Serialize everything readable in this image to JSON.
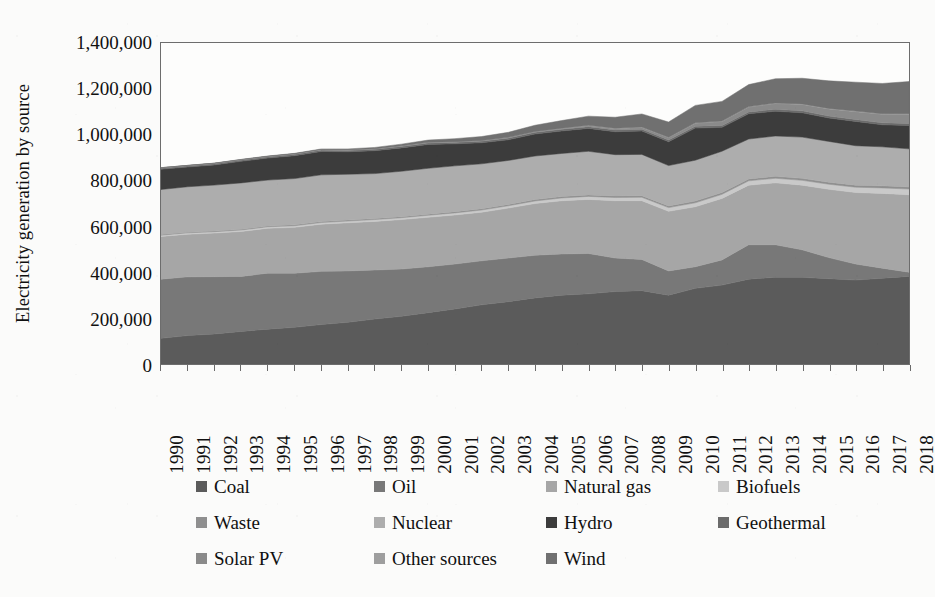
{
  "chart_data": {
    "type": "area",
    "stacked": true,
    "title": "",
    "xlabel": "",
    "ylabel": "Electricity generation by source",
    "ylim": [
      0,
      1400000
    ],
    "ytick_step": 200000,
    "yticks": [
      "0",
      "200,000",
      "400,000",
      "600,000",
      "800,000",
      "1,000,000",
      "1,200,000",
      "1,400,000"
    ],
    "ytick_values": [
      0,
      200000,
      400000,
      600000,
      800000,
      1000000,
      1200000,
      1400000
    ],
    "grid": false,
    "legend_position": "bottom",
    "categories": [
      "1990",
      "1991",
      "1992",
      "1993",
      "1994",
      "1995",
      "1996",
      "1997",
      "1998",
      "1999",
      "2000",
      "2001",
      "2002",
      "2003",
      "2004",
      "2005",
      "2006",
      "2007",
      "2008",
      "2009",
      "2010",
      "2011",
      "2012",
      "2013",
      "2014",
      "2015",
      "2016",
      "2017",
      "2018"
    ],
    "series": [
      {
        "name": "Coal",
        "color": "#5b5b5b",
        "values": [
          112000,
          124000,
          131000,
          142000,
          152000,
          160000,
          172000,
          182000,
          196000,
          208000,
          224000,
          240000,
          258000,
          272000,
          288000,
          300000,
          306000,
          316000,
          320000,
          300000,
          330000,
          344000,
          370000,
          378000,
          378000,
          372000,
          366000,
          374000,
          382000
        ]
      },
      {
        "name": "Oil",
        "color": "#787878",
        "values": [
          258000,
          256000,
          250000,
          240000,
          244000,
          236000,
          232000,
          224000,
          214000,
          206000,
          200000,
          196000,
          192000,
          190000,
          186000,
          180000,
          176000,
          146000,
          136000,
          106000,
          94000,
          110000,
          150000,
          142000,
          120000,
          92000,
          70000,
          44000,
          18000
        ]
      },
      {
        "name": "Natural gas",
        "color": "#a6a6a6",
        "values": [
          186000,
          186000,
          190000,
          196000,
          196000,
          200000,
          206000,
          210000,
          212000,
          216000,
          216000,
          214000,
          212000,
          218000,
          226000,
          232000,
          236000,
          250000,
          256000,
          260000,
          262000,
          268000,
          260000,
          270000,
          282000,
          298000,
          312000,
          326000,
          338000
        ]
      },
      {
        "name": "Biofuels",
        "color": "#c9c9c9",
        "values": [
          6000,
          6000,
          6000,
          6500,
          6500,
          7000,
          7000,
          7500,
          8000,
          8000,
          8500,
          9000,
          9500,
          10000,
          11000,
          12000,
          13000,
          14000,
          15000,
          16000,
          17000,
          18000,
          19000,
          20000,
          21000,
          22000,
          23000,
          24000,
          25000
        ]
      },
      {
        "name": "Waste",
        "color": "#8f8f8f",
        "values": [
          3000,
          3000,
          3200,
          3400,
          3600,
          3800,
          4000,
          4200,
          4400,
          4600,
          5000,
          5200,
          5500,
          5800,
          6000,
          6300,
          6600,
          7000,
          7200,
          7400,
          7800,
          8000,
          8200,
          8400,
          8600,
          8800,
          9000,
          9200,
          9400
        ]
      },
      {
        "name": "Nuclear",
        "color": "#adadad",
        "values": [
          196000,
          198000,
          200000,
          202000,
          200000,
          202000,
          204000,
          200000,
          196000,
          198000,
          200000,
          200000,
          196000,
          192000,
          190000,
          188000,
          190000,
          180000,
          180000,
          176000,
          178000,
          180000,
          174000,
          176000,
          180000,
          178000,
          172000,
          170000,
          166000
        ]
      },
      {
        "name": "Hydro",
        "color": "#3c3c3c",
        "values": [
          88000,
          86000,
          88000,
          94000,
          96000,
          100000,
          102000,
          98000,
          100000,
          102000,
          104000,
          96000,
          92000,
          90000,
          96000,
          98000,
          100000,
          100000,
          102000,
          104000,
          140000,
          104000,
          110000,
          108000,
          106000,
          102000,
          106000,
          96000,
          102000
        ]
      },
      {
        "name": "Geothermal",
        "color": "#6b6b6b",
        "values": [
          6000,
          6000,
          6200,
          6400,
          6400,
          6600,
          6600,
          6800,
          6800,
          7000,
          7000,
          7200,
          7200,
          7400,
          7400,
          7600,
          7600,
          7800,
          7800,
          8000,
          8000,
          8200,
          8200,
          8400,
          8400,
          8600,
          8600,
          8800,
          8800
        ]
      },
      {
        "name": "Solar PV",
        "color": "#8a8a8a",
        "values": [
          0,
          0,
          0,
          0,
          0,
          0,
          100,
          200,
          300,
          400,
          600,
          900,
          1200,
          1600,
          2200,
          3000,
          4000,
          5500,
          7500,
          10000,
          13000,
          17000,
          21000,
          25000,
          28000,
          31000,
          34000,
          37000,
          40000
        ]
      },
      {
        "name": "Other sources",
        "color": "#9e9e9e",
        "values": [
          1000,
          1000,
          1100,
          1100,
          1200,
          1200,
          1300,
          1300,
          1400,
          1400,
          1500,
          1500,
          1600,
          1600,
          1700,
          1800,
          1800,
          1900,
          2000,
          2000,
          2100,
          2200,
          2200,
          2300,
          2400,
          2400,
          2500,
          2600,
          2600
        ]
      },
      {
        "name": "Wind",
        "color": "#707070",
        "values": [
          200,
          400,
          700,
          1000,
          1500,
          2200,
          3000,
          4200,
          5600,
          7500,
          10000,
          13000,
          17000,
          22000,
          27000,
          33000,
          40000,
          48000,
          57000,
          66000,
          76000,
          86000,
          96000,
          106000,
          112000,
          120000,
          126000,
          132000,
          140000
        ]
      }
    ]
  },
  "legend": {
    "items": [
      {
        "label": "Coal",
        "color": "#5b5b5b"
      },
      {
        "label": "Oil",
        "color": "#787878"
      },
      {
        "label": "Natural gas",
        "color": "#a6a6a6"
      },
      {
        "label": "Biofuels",
        "color": "#c9c9c9"
      },
      {
        "label": "Waste",
        "color": "#8f8f8f"
      },
      {
        "label": "Nuclear",
        "color": "#adadad"
      },
      {
        "label": "Hydro",
        "color": "#3c3c3c"
      },
      {
        "label": "Geothermal",
        "color": "#6b6b6b"
      },
      {
        "label": "Solar PV",
        "color": "#8a8a8a"
      },
      {
        "label": "Other sources",
        "color": "#9e9e9e"
      },
      {
        "label": "Wind",
        "color": "#707070"
      }
    ]
  },
  "axes": {
    "y_title": "Electricity generation by source",
    "frame_color": "#6d6d6d"
  }
}
